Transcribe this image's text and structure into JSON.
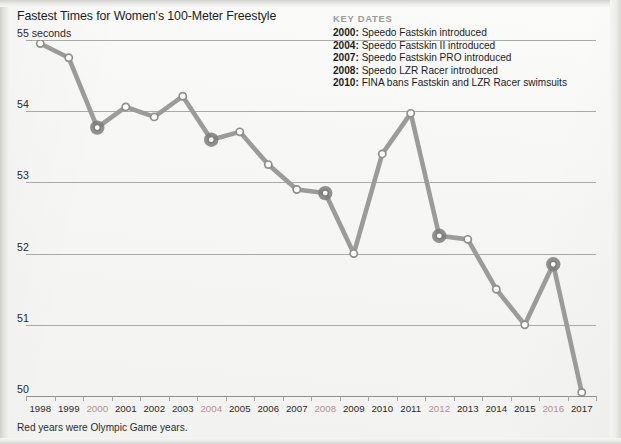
{
  "chart_data": {
    "type": "line",
    "title": "Fastest Times for Women's 100-Meter Freestyle",
    "ylabel": "55 seconds",
    "xlabel": "",
    "ylim": [
      50,
      55
    ],
    "y_ticks": [
      55,
      54,
      53,
      52,
      51,
      50
    ],
    "y_tick_labels": [
      "55 seconds",
      "54",
      "53",
      "52",
      "51",
      "50"
    ],
    "grid": true,
    "legend_position": "top-right",
    "categories": [
      "1998",
      "1999",
      "2000",
      "2001",
      "2002",
      "2003",
      "2004",
      "2005",
      "2006",
      "2007",
      "2008",
      "2009",
      "2010",
      "2011",
      "2012",
      "2013",
      "2014",
      "2015",
      "2016",
      "2017"
    ],
    "values": [
      54.95,
      54.75,
      53.77,
      54.06,
      53.92,
      54.21,
      53.6,
      53.71,
      53.25,
      52.9,
      52.85,
      52.0,
      53.4,
      53.97,
      52.25,
      52.2,
      51.5,
      51.0,
      51.85,
      50.05
    ],
    "series": [
      {
        "name": "Fastest time (seconds)",
        "values": [
          54.95,
          54.75,
          53.77,
          54.06,
          53.92,
          54.21,
          53.6,
          53.71,
          53.25,
          52.9,
          52.85,
          52.0,
          53.4,
          53.97,
          52.25,
          52.2,
          51.5,
          51.0,
          51.85,
          50.05
        ]
      }
    ],
    "highlighted_categories": [
      "2000",
      "2004",
      "2008",
      "2012",
      "2016"
    ],
    "annotations": [
      "Red years were Olympic Game years."
    ],
    "colors": {
      "line": "#9b9b99",
      "marker_fill": "#ffffff",
      "marker_stroke": "#8f8f8d",
      "highlight_halo": "#7e7e7c",
      "olympic_label": "#b9908f",
      "gridline": "#a9a9a7",
      "heading": "#9a9a98",
      "text": "#1d1d1d",
      "background": "#f6f6f4"
    }
  },
  "key_dates": {
    "heading": "KEY DATES",
    "entries": [
      {
        "year": "2000:",
        "text": "Speedo Fastskin introduced"
      },
      {
        "year": "2004:",
        "text": "Speedo Fastskin II introduced"
      },
      {
        "year": "2007:",
        "text": "Speedo Fastskin PRO introduced"
      },
      {
        "year": "2008:",
        "text": "Speedo LZR Racer introduced"
      },
      {
        "year": "2010:",
        "text": "FINA bans Fastskin and LZR Racer swimsuits"
      }
    ]
  },
  "footnote": "Red years were Olympic Game years."
}
